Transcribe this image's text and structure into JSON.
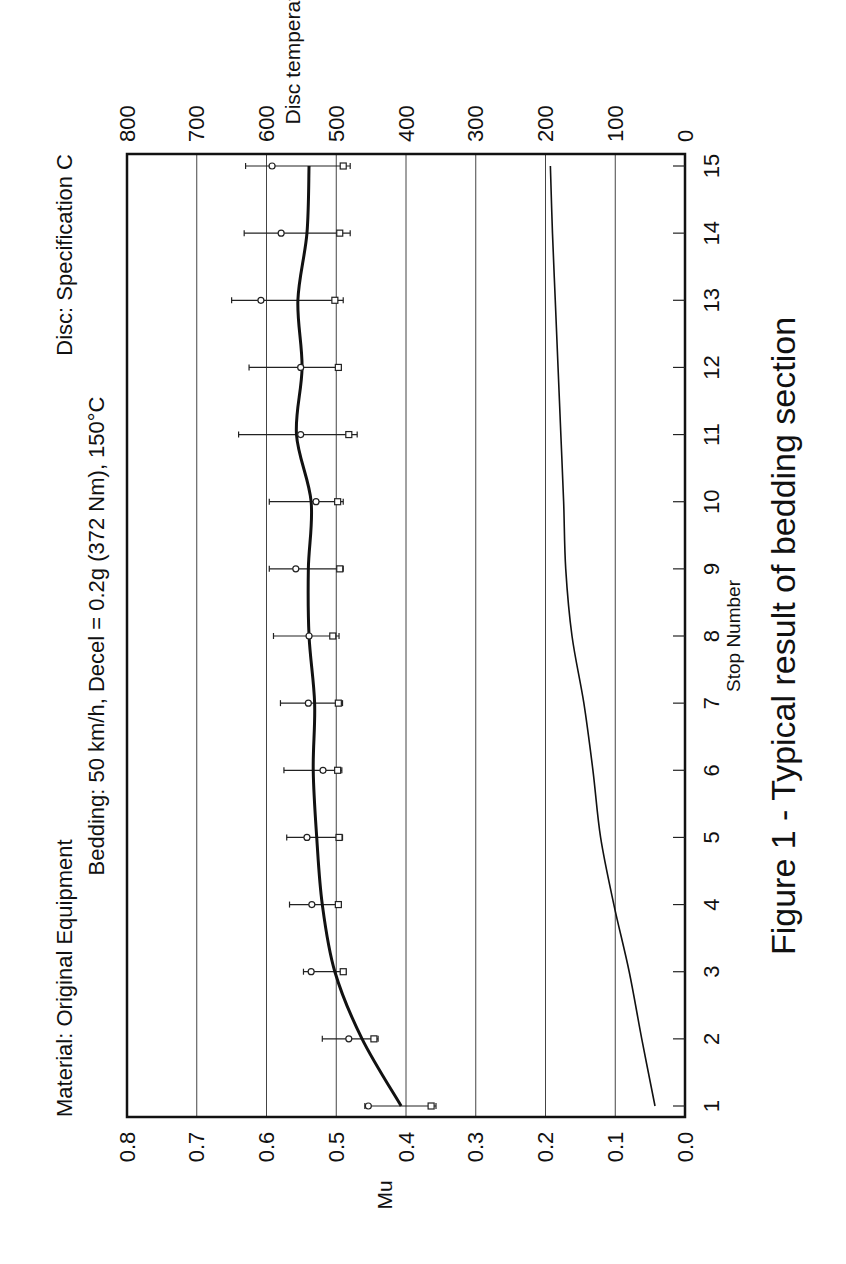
{
  "figure": {
    "header_left": "Material: Original Equipment",
    "header_right": "Disc: Specification C",
    "subheader": "Bedding: 50 km/h, Decel = 0.2g (372 Nm), 150°C",
    "caption": "Figure 1 - Typical result of bedding section"
  },
  "axes": {
    "x_title": "Stop Number",
    "y_title": "Mu",
    "y2_title": "Disc temperature [°C]",
    "x_ticks": [
      "1",
      "2",
      "3",
      "4",
      "5",
      "6",
      "7",
      "8",
      "9",
      "10",
      "11",
      "12",
      "13",
      "14",
      "15"
    ],
    "y_ticks": [
      "0.0",
      "0.1",
      "0.2",
      "0.3",
      "0.4",
      "0.5",
      "0.6",
      "0.7",
      "0.8"
    ],
    "y2_ticks": [
      "0",
      "100",
      "200",
      "300",
      "400",
      "500",
      "600",
      "700",
      "800"
    ]
  },
  "chart_data": {
    "type": "line",
    "caption": "Figure 1 - Typical result of bedding section",
    "xlabel": "Stop Number",
    "ylabel": "Mu",
    "y2label": "Disc temperature [°C]",
    "x": [
      1,
      2,
      3,
      4,
      5,
      6,
      7,
      8,
      9,
      10,
      11,
      12,
      13,
      14,
      15
    ],
    "xlim": [
      1,
      15
    ],
    "ylim": [
      0.0,
      0.8
    ],
    "y2lim": [
      0,
      800
    ],
    "grid": true,
    "orientation_note": "figure rendered rotated 90° clockwise",
    "series": [
      {
        "name": "Mean Mu",
        "axis": "y",
        "style": "thick line",
        "values": [
          0.407,
          0.463,
          0.502,
          0.52,
          0.528,
          0.533,
          0.531,
          0.539,
          0.54,
          0.536,
          0.557,
          0.549,
          0.555,
          0.542,
          0.539
        ]
      },
      {
        "name": "Mu (circle marker)",
        "axis": "y",
        "style": "circle marker",
        "values": [
          0.454,
          0.482,
          0.536,
          0.535,
          0.542,
          0.519,
          0.54,
          0.539,
          0.558,
          0.529,
          0.551,
          0.551,
          0.608,
          0.579,
          0.592
        ]
      },
      {
        "name": "Mu (square marker)",
        "axis": "y",
        "style": "square marker",
        "values": [
          0.364,
          0.446,
          0.49,
          0.497,
          0.496,
          0.498,
          0.497,
          0.505,
          0.495,
          0.498,
          0.482,
          0.497,
          0.502,
          0.495,
          0.49
        ]
      },
      {
        "name": "Mu error bar low",
        "axis": "y",
        "style": "error bar",
        "values": [
          0.357,
          0.44,
          0.486,
          0.493,
          0.491,
          0.492,
          0.491,
          0.496,
          0.49,
          0.49,
          0.47,
          0.493,
          0.49,
          0.48,
          0.48
        ]
      },
      {
        "name": "Mu error bar high",
        "axis": "y",
        "style": "error bar",
        "values": [
          0.459,
          0.52,
          0.547,
          0.567,
          0.571,
          0.575,
          0.58,
          0.59,
          0.596,
          0.596,
          0.64,
          0.625,
          0.65,
          0.632,
          0.63
        ]
      },
      {
        "name": "Disc temperature",
        "axis": "y2",
        "style": "thin line",
        "values": [
          43,
          62,
          80,
          102,
          121,
          132,
          145,
          162,
          171,
          174,
          178,
          182,
          186,
          190,
          193
        ]
      }
    ]
  }
}
